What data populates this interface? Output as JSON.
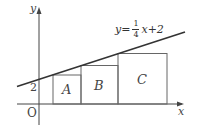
{
  "axes": {
    "x_label": "x",
    "y_label": "y",
    "origin_label": "O",
    "y_intercept_label": "2"
  },
  "line": {
    "equation_prefix": "y=",
    "numerator": "1",
    "denominator": "4",
    "equation_suffix": "x+2"
  },
  "boxes": [
    {
      "label": "A"
    },
    {
      "label": "B"
    },
    {
      "label": "C"
    }
  ],
  "colors": {
    "line": "#333333",
    "box": "#666666",
    "axis": "#444444"
  }
}
